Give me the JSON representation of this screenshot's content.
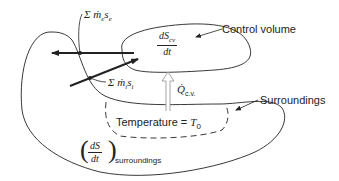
{
  "diagram": {
    "type": "entropy-generation-control-volume",
    "labels": {
      "control_volume": "Control volume",
      "surroundings": "Surroundings",
      "temperature": "Temperature = ",
      "temperature_symbol": "T",
      "temperature_sub": "0",
      "exit_flow_sum": "Σ ṁ",
      "exit_flow_sub1": "e",
      "exit_flow_s": "s",
      "exit_flow_sub2": "e",
      "inlet_flow_sum": "Σ ṁ",
      "inlet_flow_sub1": "i",
      "inlet_flow_s": "s",
      "inlet_flow_sub2": "i",
      "heat_symbol": "Q̇",
      "heat_sub": "c.v.",
      "cv_rate_num": "dS",
      "cv_rate_num_sub": "cv",
      "cv_rate_den": "dt",
      "surr_rate_num": "dS",
      "surr_rate_den": "dt",
      "surr_rate_sub": "surroundings"
    },
    "colors": {
      "stroke": "#222222",
      "heat_arrow": "#9a9a9a",
      "background": "#ffffff"
    }
  }
}
